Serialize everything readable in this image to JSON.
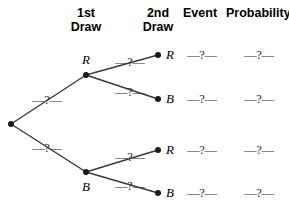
{
  "headers": {
    "first_draw": {
      "line1": "1st",
      "line2": "Draw"
    },
    "second_draw": {
      "line1": "2nd",
      "line2": "Draw"
    },
    "event": "Event",
    "probability": "Probability"
  },
  "blank": "—?—",
  "tree": {
    "root": {
      "label": ""
    },
    "first_draw_nodes": [
      {
        "label": "R",
        "branch_label": "—?—"
      },
      {
        "label": "B",
        "branch_label": "—?—"
      }
    ],
    "second_draw_nodes": [
      {
        "label": "R",
        "branch_label": "—?—",
        "event": "—?—",
        "probability": "—?—"
      },
      {
        "label": "B",
        "branch_label": "—?—",
        "event": "—?—",
        "probability": "—?—"
      },
      {
        "label": "R",
        "branch_label": "—?—",
        "event": "—?—",
        "probability": "—?—"
      },
      {
        "label": "B",
        "branch_label": "—?—",
        "event": "—?—",
        "probability": "—?—"
      }
    ]
  },
  "colors": {
    "line": "#3a3a3a",
    "node": "#1a1a1a",
    "text": "#000000",
    "background": "#ffffff"
  }
}
